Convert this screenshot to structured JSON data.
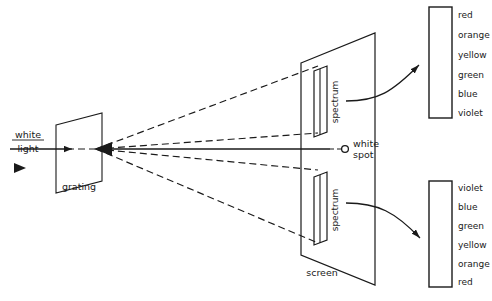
{
  "diagram": {
    "background_color": "#ffffff",
    "ink_color": "#1a1a1a",
    "labels": {
      "white": "white",
      "light": "light",
      "grating": "grating",
      "screen": "screen",
      "spectrum_upper": "spectrum",
      "spectrum_lower": "spectrum",
      "white_spot_line1": "white",
      "white_spot_line2": "spot"
    },
    "color_lists": [
      {
        "name": "upper-spectrum-colors",
        "order": "red-to-violet",
        "entries": [
          "red",
          "orange",
          "yellow",
          "green",
          "blue",
          "violet"
        ]
      },
      {
        "name": "lower-spectrum-colors",
        "order": "violet-to-red",
        "entries": [
          "violet",
          "blue",
          "green",
          "yellow",
          "orange",
          "red"
        ]
      }
    ],
    "elements": {
      "incoming_beam": "solid arrow pointing right into grating",
      "direction_marker": "small solid triangle below white light label",
      "rays": "dashed diverging rays from grating to screen",
      "zero_order": "solid horizontal ray to white spot",
      "callout_arrows": "two curved arrows from spectrum bands to color lists"
    }
  }
}
